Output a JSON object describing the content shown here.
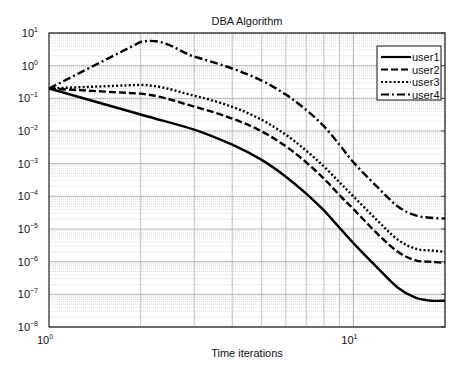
{
  "chart_data": {
    "type": "line",
    "title": "DBA Algorithm",
    "xlabel": "Time iterations",
    "ylabel": "",
    "xscale": "log",
    "yscale": "log",
    "xlim": [
      1,
      20
    ],
    "ylim": [
      1e-08,
      10
    ],
    "grid": "major and minor",
    "legend_position": "upper right",
    "x_ticks": [
      {
        "base": "10",
        "exp": "0",
        "value": 1
      },
      {
        "base": "10",
        "exp": "1",
        "value": 10
      }
    ],
    "y_ticks": [
      {
        "base": "10",
        "exp": "1",
        "value": 10
      },
      {
        "base": "10",
        "exp": "0",
        "value": 1
      },
      {
        "base": "10",
        "exp": "−1",
        "value": 0.1
      },
      {
        "base": "10",
        "exp": "−2",
        "value": 0.01
      },
      {
        "base": "10",
        "exp": "−3",
        "value": 0.001
      },
      {
        "base": "10",
        "exp": "−4",
        "value": 0.0001
      },
      {
        "base": "10",
        "exp": "−5",
        "value": 1e-05
      },
      {
        "base": "10",
        "exp": "−6",
        "value": 1e-06
      },
      {
        "base": "10",
        "exp": "−7",
        "value": 1e-07
      },
      {
        "base": "10",
        "exp": "−8",
        "value": 1e-08
      }
    ],
    "x": [
      1,
      2,
      3,
      4,
      5,
      6,
      7,
      8,
      9,
      10,
      12,
      14,
      16,
      18,
      20
    ],
    "series": [
      {
        "name": "user1",
        "style": "solid",
        "values": [
          0.2,
          0.032,
          0.011,
          0.0038,
          0.0013,
          0.0004,
          0.00012,
          3.7e-05,
          1.1e-05,
          3.7e-06,
          6.5e-07,
          1.6e-07,
          7.9e-08,
          6.4e-08,
          6.4e-08
        ]
      },
      {
        "name": "user2",
        "style": "dashed",
        "values": [
          0.2,
          0.14,
          0.056,
          0.024,
          0.0097,
          0.0034,
          0.0011,
          0.00035,
          0.00011,
          4.1e-05,
          7.1e-06,
          2e-06,
          1.1e-06,
          9.9e-07,
          9.2e-07
        ]
      },
      {
        "name": "user3",
        "style": "dotted",
        "values": [
          0.2,
          0.26,
          0.12,
          0.055,
          0.022,
          0.0077,
          0.0025,
          0.00082,
          0.00027,
          0.0001,
          1.8e-05,
          4.7e-06,
          2.5e-06,
          2.2e-06,
          2e-06
        ]
      },
      {
        "name": "user4",
        "style": "dashdot",
        "values": [
          0.2,
          5.3,
          1.9,
          0.82,
          0.35,
          0.13,
          0.044,
          0.014,
          0.0038,
          0.0011,
          0.00019,
          4.9e-05,
          2.6e-05,
          2.2e-05,
          2.1e-05
        ]
      }
    ]
  },
  "legend": {
    "items": [
      {
        "label": "user1"
      },
      {
        "label": "user2"
      },
      {
        "label": "user3"
      },
      {
        "label": "user4"
      }
    ]
  }
}
